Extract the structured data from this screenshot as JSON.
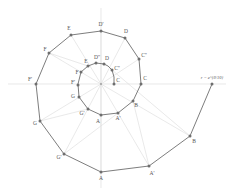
{
  "diagram": {
    "equation_label": "r = e^{θ/10}",
    "colors": {
      "background": "#ffffff",
      "axis": "#d8d8d8",
      "ray": "#e0e0e0",
      "spiral": "#6e6e6e",
      "point": "#6e6e6e",
      "label": "#555555"
    },
    "center": {
      "x": 101,
      "y": 84
    },
    "axes": {
      "horizontal": {
        "x1": 8,
        "y1": 84,
        "x2": 226,
        "y2": 84
      },
      "vertical": {
        "x1": 101,
        "y1": 8,
        "x2": 101,
        "y2": 188
      }
    },
    "points": [
      {
        "id": "Dp",
        "label": "D'",
        "x": 101,
        "y": 31,
        "lx": 101,
        "ly": 25
      },
      {
        "id": "E",
        "label": "E",
        "x": 71,
        "y": 35,
        "lx": 69,
        "ly": 29
      },
      {
        "id": "Fo",
        "label": "F",
        "x": 49,
        "y": 53,
        "lx": 45,
        "ly": 50
      },
      {
        "id": "Fp",
        "label": "F'",
        "x": 36,
        "y": 84,
        "lx": 30,
        "ly": 80
      },
      {
        "id": "Go",
        "label": "G",
        "x": 40,
        "y": 121,
        "lx": 35,
        "ly": 124
      },
      {
        "id": "Gp",
        "label": "G'",
        "x": 64,
        "y": 154,
        "lx": 59,
        "ly": 158
      },
      {
        "id": "Ao",
        "label": "A",
        "x": 101,
        "y": 172,
        "lx": 101,
        "ly": 179
      },
      {
        "id": "Ap",
        "label": "A'",
        "x": 149,
        "y": 166,
        "lx": 152,
        "ly": 174
      },
      {
        "id": "Bo",
        "label": "B",
        "x": 190,
        "y": 136,
        "lx": 194,
        "ly": 142
      },
      {
        "id": "End",
        "label": "",
        "x": 212,
        "y": 84,
        "lx": 212,
        "ly": 79
      },
      {
        "id": "Do",
        "label": "D",
        "x": 125,
        "y": 38,
        "lx": 126,
        "ly": 32
      },
      {
        "id": "Cpp",
        "label": "C''",
        "x": 139,
        "y": 59,
        "lx": 144,
        "ly": 56
      },
      {
        "id": "Co",
        "label": "C",
        "x": 141,
        "y": 84,
        "lx": 145,
        "ly": 79
      },
      {
        "id": "iB",
        "label": "B",
        "x": 133,
        "y": 101,
        "lx": 136,
        "ly": 106
      },
      {
        "id": "iAp",
        "label": "A'",
        "x": 118,
        "y": 113,
        "lx": 118,
        "ly": 119
      },
      {
        "id": "iA",
        "label": "A",
        "x": 101,
        "y": 115,
        "lx": 98,
        "ly": 122
      },
      {
        "id": "iGp",
        "label": "G'",
        "x": 88,
        "y": 109,
        "lx": 82,
        "ly": 114
      },
      {
        "id": "iG",
        "label": "G",
        "x": 79,
        "y": 97,
        "lx": 73,
        "ly": 97
      },
      {
        "id": "iFp",
        "label": "F'",
        "x": 78,
        "y": 85,
        "lx": 73,
        "ly": 83
      },
      {
        "id": "iF",
        "label": "F",
        "x": 81,
        "y": 72,
        "lx": 77,
        "ly": 73
      },
      {
        "id": "iE",
        "label": "E",
        "x": 88,
        "y": 66,
        "lx": 86,
        "ly": 62
      },
      {
        "id": "iDpp",
        "label": "D''",
        "x": 96,
        "y": 63,
        "lx": 97,
        "ly": 58
      },
      {
        "id": "iD",
        "label": "D",
        "x": 104,
        "y": 64,
        "lx": 107,
        "ly": 59
      },
      {
        "id": "iC2",
        "label": "C''",
        "x": 112,
        "y": 70,
        "lx": 117,
        "ly": 69
      },
      {
        "id": "iC",
        "label": "C",
        "x": 114,
        "y": 84,
        "lx": 118,
        "ly": 81
      }
    ],
    "spiral_path": "M 114 84 L 114 77 L 112 70 L 108 66 L 104 64 L 96 63 L 88 66 L 81 72 L 78 84 L 79 97 L 88 109 L 101 115 L 118 113 L 133 101 L 141 84 L 139 59 L 125 38 L 101 31 L 71 35 L 49 53 L 36 84 L 40 121 L 64 154 L 101 172 L 149 166 L 190 136 L 212 84",
    "rays": [
      {
        "x2": 101,
        "y2": 31
      },
      {
        "x2": 71,
        "y2": 35
      },
      {
        "x2": 49,
        "y2": 53
      },
      {
        "x2": 40,
        "y2": 121
      },
      {
        "x2": 64,
        "y2": 154
      },
      {
        "x2": 101,
        "y2": 172
      },
      {
        "x2": 149,
        "y2": 166
      },
      {
        "x2": 190,
        "y2": 136
      },
      {
        "x2": 125,
        "y2": 38
      },
      {
        "x2": 139,
        "y2": 59
      }
    ]
  }
}
